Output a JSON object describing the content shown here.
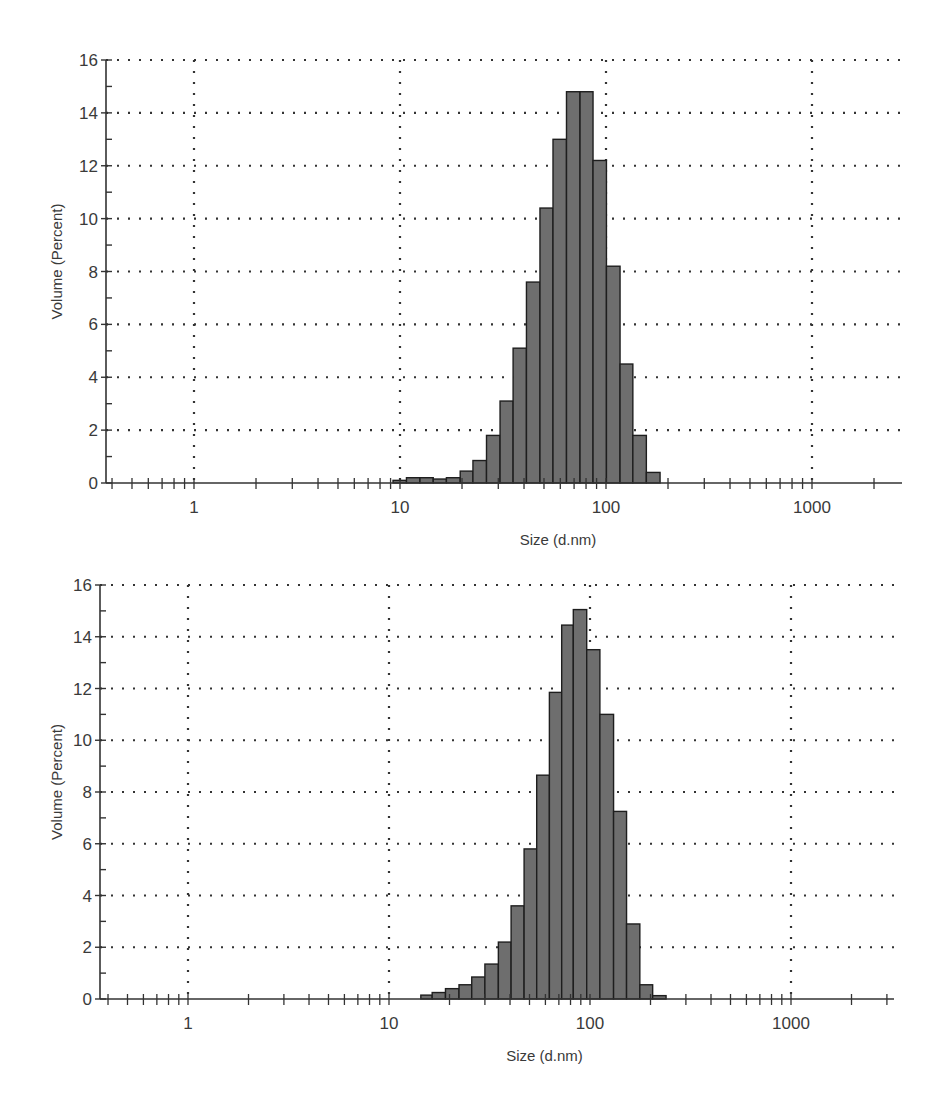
{
  "chart_data": [
    {
      "type": "bar",
      "title": "",
      "xlabel": "Size (d.nm)",
      "ylabel": "Volume (Percent)",
      "xscale": "log",
      "xlim": [
        0.37,
        2750
      ],
      "ylim": [
        0,
        16
      ],
      "grid": true,
      "legend": null,
      "x_ticks": [
        1,
        10,
        100,
        1000
      ],
      "x_tick_labels": [
        "1",
        "10",
        "100",
        "1000"
      ],
      "y_ticks": [
        0,
        2,
        4,
        6,
        8,
        10,
        12,
        14,
        16
      ],
      "y_tick_labels": [
        "0",
        "2",
        "4",
        "6",
        "8",
        "10",
        "12",
        "14",
        "16"
      ],
      "bin_edges": [
        9.25,
        10.75,
        12.5,
        14.5,
        16.8,
        19.6,
        22.6,
        26.3,
        30.6,
        35.4,
        41.1,
        47.8,
        55.3,
        64.3,
        74.8,
        86.5,
        100.5,
        117,
        135,
        157,
        183
      ],
      "values": [
        0.1,
        0.2,
        0.2,
        0.15,
        0.2,
        0.45,
        0.85,
        1.8,
        3.1,
        5.1,
        7.6,
        10.4,
        13.0,
        14.8,
        14.8,
        12.2,
        8.2,
        4.5,
        1.8,
        0.4
      ],
      "bar_color": "#6e6e6e",
      "bar_edge_color": "#1e1e1e"
    },
    {
      "type": "bar",
      "title": "",
      "xlabel": "Size (d.nm)",
      "ylabel": "Volume (Percent)",
      "xscale": "log",
      "xlim": [
        0.365,
        3250
      ],
      "ylim": [
        0,
        16
      ],
      "grid": true,
      "legend": null,
      "x_ticks": [
        1,
        10,
        100,
        1000
      ],
      "x_tick_labels": [
        "1",
        "10",
        "100",
        "1000"
      ],
      "y_ticks": [
        0,
        2,
        4,
        6,
        8,
        10,
        12,
        14,
        16
      ],
      "y_tick_labels": [
        "0",
        "2",
        "4",
        "6",
        "8",
        "10",
        "12",
        "14",
        "16"
      ],
      "bin_edges": [
        14.4,
        16.4,
        19.1,
        22.3,
        25.8,
        30.0,
        35.0,
        40.5,
        47.0,
        54.3,
        62.8,
        72.3,
        82.6,
        96.3,
        112,
        131,
        152,
        177,
        205,
        239
      ],
      "values": [
        0.15,
        0.25,
        0.4,
        0.55,
        0.85,
        1.35,
        2.2,
        3.6,
        5.8,
        8.65,
        11.85,
        14.45,
        15.05,
        13.5,
        11.0,
        7.25,
        2.9,
        0.55,
        0.13
      ],
      "bar_color": "#6e6e6e",
      "bar_edge_color": "#1e1e1e"
    }
  ],
  "layout": [
    {
      "plot_left": 106,
      "plot_right": 902,
      "plot_top": 60,
      "plot_bottom": 483,
      "decade_px": 206,
      "x_at_1": 194
    },
    {
      "plot_left": 100,
      "plot_right": 894,
      "plot_top": 40,
      "plot_bottom": 454,
      "decade_px": 201,
      "x_at_1": 188
    }
  ]
}
